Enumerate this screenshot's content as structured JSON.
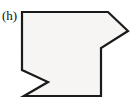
{
  "figure": {
    "label": "(h)",
    "kind": "polygon-outline-figure",
    "canvas": {
      "width": 131,
      "height": 106
    },
    "style": {
      "background_color": "#ffffff",
      "fill_color": "#f6f5f3",
      "stroke_color": "#1a1a1a",
      "stroke_width": 2.2,
      "label_color": "#101010"
    },
    "shape": {
      "name": "concave-arrow-block-polygon",
      "closed": true,
      "vertex_count": 8,
      "points_attr": "22,12 108,12 128,31 101,48 101,96 24,96 48,82 22,70",
      "vertices": [
        {
          "index": 1,
          "x": 22,
          "y": 12,
          "desc": "top-left corner"
        },
        {
          "index": 2,
          "x": 108,
          "y": 12,
          "desc": "top edge right end"
        },
        {
          "index": 3,
          "x": 128,
          "y": 31,
          "desc": "right arrow tip"
        },
        {
          "index": 4,
          "x": 101,
          "y": 48,
          "desc": "arrow inner reflex corner"
        },
        {
          "index": 5,
          "x": 101,
          "y": 96,
          "desc": "bottom-right corner"
        },
        {
          "index": 6,
          "x": 24,
          "y": 96,
          "desc": "bottom-left corner"
        },
        {
          "index": 7,
          "x": 48,
          "y": 82,
          "desc": "left notch reflex point"
        },
        {
          "index": 8,
          "x": 22,
          "y": 70,
          "desc": "left edge lower end"
        }
      ]
    }
  }
}
